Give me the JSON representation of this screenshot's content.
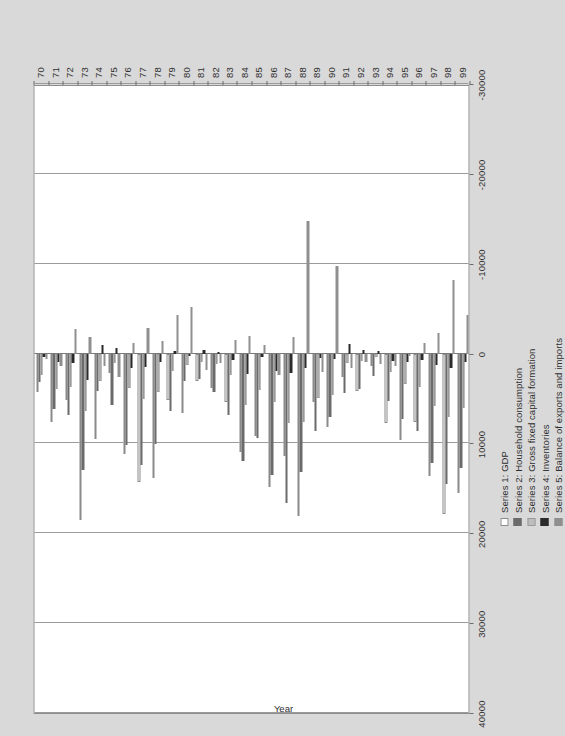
{
  "chart_data": {
    "type": "bar",
    "orientation": "vertical-grouped-rendered-rotated",
    "title": "",
    "xlabel": "Year",
    "ylabel": "",
    "ylim": [
      -30000,
      40000
    ],
    "grid": true,
    "legend_position": "bottom-left",
    "value_ticks": [
      "40000",
      "30000",
      "20000",
      "10000",
      "0",
      "-10000",
      "-20000",
      "-30000"
    ],
    "value_tick_numbers": [
      40000,
      30000,
      20000,
      10000,
      0,
      -10000,
      -20000,
      -30000
    ],
    "categories": [
      "70",
      "71",
      "72",
      "73",
      "74",
      "75",
      "76",
      "77",
      "78",
      "79",
      "80",
      "81",
      "82",
      "83",
      "84",
      "85",
      "86",
      "87",
      "88",
      "89",
      "90",
      "91",
      "92",
      "93",
      "94",
      "95",
      "96",
      "97",
      "98",
      "99"
    ],
    "series": [
      {
        "name": "Series 1: GDP",
        "color": "#ffffff",
        "values": [
          4300,
          7600,
          5200,
          18500,
          9500,
          2200,
          11200,
          14300,
          13900,
          5200,
          6600,
          3100,
          3800,
          5400,
          11000,
          9200,
          14800,
          11400,
          18100,
          5400,
          8200,
          2600,
          4200,
          1400,
          7700,
          9600,
          7600,
          13600,
          17800,
          15500
        ]
      },
      {
        "name": "Series 2: Household consumption",
        "color": "#6b6b6b",
        "values": [
          3200,
          6200,
          6800,
          13000,
          4200,
          5700,
          10200,
          12400,
          10100,
          6400,
          3000,
          2800,
          4300,
          6800,
          12000,
          9400,
          13500,
          16600,
          13200,
          8600,
          7100,
          4400,
          3900,
          2500,
          5300,
          7300,
          8600,
          12200,
          14500,
          12700
        ]
      },
      {
        "name": "Series 3: Gross fixed capital formation",
        "color": "#bdbdbd",
        "values": [
          2400,
          3900,
          3700,
          6400,
          3000,
          1100,
          3800,
          5100,
          4300,
          1900,
          1300,
          900,
          1200,
          2400,
          5700,
          4100,
          5400,
          7700,
          7600,
          4900,
          4600,
          1100,
          800,
          400,
          2100,
          3400,
          3700,
          5800,
          7100,
          6100
        ]
      },
      {
        "name": "Series 4: Inventories",
        "color": "#2b2b2b",
        "values": [
          400,
          900,
          1100,
          2900,
          -900,
          -600,
          1600,
          1500,
          900,
          -300,
          300,
          -400,
          -200,
          700,
          2300,
          400,
          1900,
          2200,
          1600,
          500,
          600,
          -1100,
          -400,
          -300,
          800,
          900,
          700,
          1300,
          1600,
          900
        ]
      },
      {
        "name": "Series 5: Balance of exports and imports",
        "color": "#8f8f8f",
        "values": [
          600,
          1400,
          -2700,
          -1800,
          1400,
          2600,
          -1200,
          -2900,
          -1400,
          -4300,
          -5200,
          1800,
          1000,
          -1500,
          -2000,
          -1000,
          2400,
          -1900,
          -14800,
          2100,
          -9700,
          1600,
          900,
          1200,
          1400,
          300,
          -1200,
          -2300,
          -8200,
          -4300
        ]
      }
    ]
  },
  "legend": {
    "items": [
      {
        "label": "Series 1: GDP",
        "swatch": "#ffffff",
        "border": "#8a8a8a"
      },
      {
        "label": "Series 2: Household consumption",
        "swatch": "#6b6b6b",
        "border": "#6b6b6b"
      },
      {
        "label": "Series 3: Gross fixed capital formation",
        "swatch": "#bdbdbd",
        "border": "#9a9a9a"
      },
      {
        "label": "Series 4: Inventories",
        "swatch": "#2b2b2b",
        "border": "#2b2b2b"
      },
      {
        "label": "Series 5: Balance of exports and imports",
        "swatch": "#8f8f8f",
        "border": "#8f8f8f"
      }
    ]
  },
  "axes": {
    "year_axis_title": "Year"
  },
  "colors": {
    "page_background": "#d9d9d9",
    "plot_background": "#ffffff",
    "frame": "#8d8d8d",
    "gridline": "#9a9a9a",
    "text": "#2f2f2f"
  }
}
